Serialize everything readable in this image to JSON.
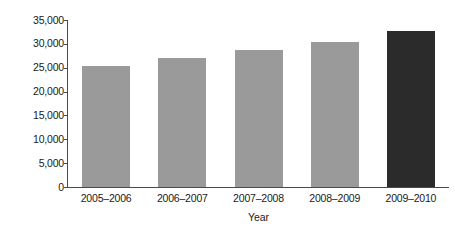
{
  "chart_data": {
    "type": "bar",
    "title": "",
    "subtitle": "",
    "xlabel": "Year",
    "ylabel": "Recurrent expenditure (A$ million)",
    "categories": [
      "2005–2006",
      "2006–2007",
      "2007–2008",
      "2008–2009",
      "2009–2010"
    ],
    "values": [
      25400,
      27000,
      28800,
      30300,
      32800
    ],
    "series": [
      {
        "name": "Recurrent expenditure",
        "values": [
          25400,
          27000,
          28800,
          30300,
          32800
        ]
      }
    ],
    "ylim": [
      0,
      35000
    ],
    "ytick_values": [
      0,
      5000,
      10000,
      15000,
      20000,
      25000,
      30000,
      35000
    ],
    "ytick_labels": [
      "0",
      "5,000",
      "10,000",
      "15,000",
      "20,000",
      "25,000",
      "30,000",
      "35,000"
    ],
    "bar_colors": [
      "#9a9a9a",
      "#9a9a9a",
      "#9a9a9a",
      "#9a9a9a",
      "#2b2b2b"
    ],
    "highlight_color": "#2b2b2b",
    "default_bar_color": "#9a9a9a",
    "axis_color": "#4a4a4a",
    "background_color": "#ffffff",
    "grid": false,
    "legend": false,
    "legend_position": "none",
    "annotations": []
  }
}
